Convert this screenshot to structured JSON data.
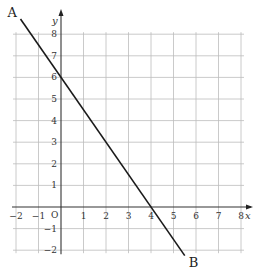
{
  "chart_data": {
    "type": "line",
    "title": "",
    "xlabel": "x",
    "ylabel": "y",
    "origin_label": "O",
    "xlim": [
      -2,
      8
    ],
    "ylim": [
      -2,
      8
    ],
    "grid": true,
    "x_ticks": [
      -2,
      -1,
      1,
      2,
      3,
      4,
      5,
      6,
      7,
      8
    ],
    "y_ticks": [
      8,
      7,
      6,
      5,
      4,
      3,
      2,
      1,
      -1,
      -2
    ],
    "series": [
      {
        "name": "AB",
        "equation": "y = -1.5x + 6",
        "x": [
          -1.8,
          0,
          4,
          5.5
        ],
        "y": [
          8.7,
          6,
          0,
          -2.25
        ],
        "y_intercept": 6,
        "x_intercept": 4
      }
    ],
    "points": [
      {
        "label": "A",
        "x": -1.8,
        "y": 8.7
      },
      {
        "label": "B",
        "x": 5.5,
        "y": -2.25
      }
    ]
  },
  "labels": {
    "x_axis": "x",
    "y_axis": "y",
    "origin": "O",
    "point_a": "A",
    "point_b": "B"
  },
  "colors": {
    "grid": "#bdbdbd",
    "axis": "#333333",
    "line": "#1a1a1a"
  }
}
